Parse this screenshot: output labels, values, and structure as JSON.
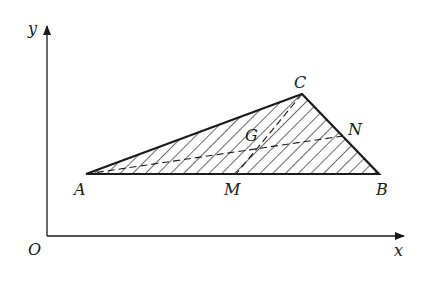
{
  "figure": {
    "axes": {
      "x_label": "x",
      "y_label": "y",
      "origin_label": "O"
    },
    "points": {
      "A": {
        "label": "A"
      },
      "B": {
        "label": "B"
      },
      "C": {
        "label": "C"
      },
      "M": {
        "label": "M"
      },
      "N": {
        "label": "N"
      },
      "G": {
        "label": "G"
      }
    },
    "segments": [
      {
        "from": "A",
        "to": "B",
        "style": "solid"
      },
      {
        "from": "B",
        "to": "C",
        "style": "solid"
      },
      {
        "from": "C",
        "to": "A",
        "style": "solid"
      },
      {
        "from": "C",
        "to": "M",
        "style": "dashed"
      },
      {
        "from": "A",
        "to": "N",
        "style": "dashed"
      }
    ],
    "fill": "hatched",
    "colors": {
      "ink": "#1a1a1a",
      "background": "#ffffff"
    }
  }
}
